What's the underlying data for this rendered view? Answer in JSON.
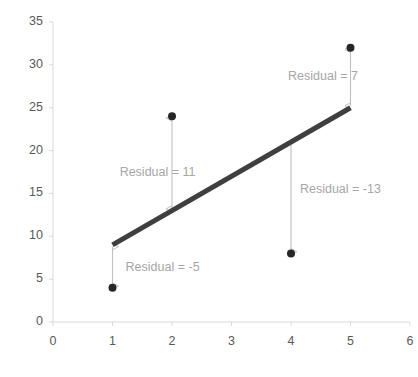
{
  "chart_data": {
    "type": "scatter",
    "title": "",
    "xlabel": "",
    "ylabel": "",
    "xlim": [
      0,
      6
    ],
    "ylim": [
      0,
      35
    ],
    "grid": false,
    "legend": "none",
    "x_ticks": [
      "0",
      "1",
      "2",
      "3",
      "4",
      "5",
      "6"
    ],
    "y_ticks": [
      "0",
      "5",
      "10",
      "15",
      "20",
      "25",
      "30",
      "35"
    ],
    "series": [
      {
        "name": "observed points",
        "type": "scatter",
        "color": "#262626",
        "points": [
          {
            "x": 1,
            "y": 4
          },
          {
            "x": 2,
            "y": 24
          },
          {
            "x": 4,
            "y": 8
          },
          {
            "x": 5,
            "y": 32
          }
        ]
      },
      {
        "name": "regression line",
        "type": "line",
        "color": "#3f3f3f",
        "points": [
          {
            "x": 1,
            "y": 9
          },
          {
            "x": 5,
            "y": 25
          }
        ]
      }
    ],
    "annotations": [
      {
        "label": "Residual = -5",
        "value": -5,
        "x": 1,
        "from_y": 9,
        "to_y": 4,
        "arrow": "double",
        "label_x": 1.22,
        "label_y": 6.3,
        "color": "#a6a6a6"
      },
      {
        "label": "Residual = 11",
        "value": 11,
        "x": 2,
        "from_y": 13,
        "to_y": 24,
        "arrow": "double",
        "label_x": 1.12,
        "label_y": 17.4,
        "color": "#a6a6a6"
      },
      {
        "label": "Residual = -13",
        "value": -13,
        "x": 4,
        "from_y": 21,
        "to_y": 8,
        "arrow": "single",
        "label_x": 4.15,
        "label_y": 15.4,
        "color": "#a6a6a6"
      },
      {
        "label": "Residual = 7",
        "value": 7,
        "x": 5,
        "from_y": 25,
        "to_y": 32,
        "arrow": "double",
        "label_x": 3.95,
        "label_y": 28.6,
        "color": "#a6a6a6"
      }
    ],
    "axis_color": "#d9d9d9",
    "tick_label_color": "#595959"
  }
}
